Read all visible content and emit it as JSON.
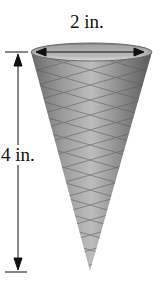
{
  "figure": {
    "top_dimension_label": "2 in.",
    "height_dimension_label": "4 in.",
    "colors": {
      "line": "#111111",
      "cone_dark": "#555555",
      "cone_light": "#c8c8c8",
      "background": "#ffffff"
    }
  }
}
